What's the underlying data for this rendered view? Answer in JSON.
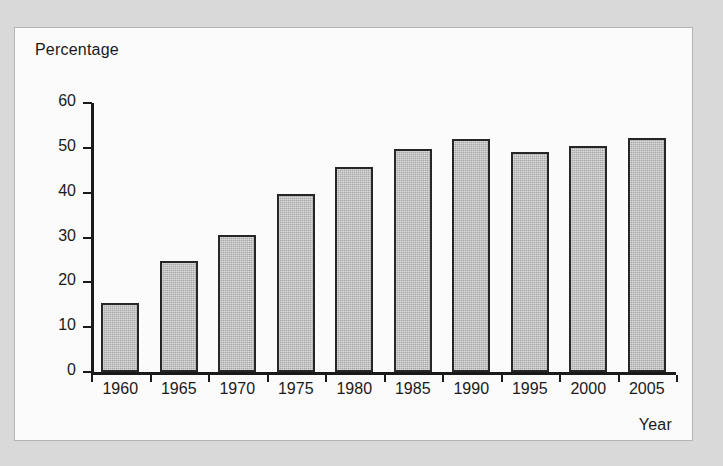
{
  "figure": {
    "background_color": "#d9d9d9",
    "panel_color": "#fbfbfb",
    "panel_border_color": "#b4b4b4"
  },
  "chart_data": {
    "type": "bar",
    "title": "",
    "xlabel": "Year",
    "ylabel": "Percentage",
    "categories": [
      "1960",
      "1965",
      "1970",
      "1975",
      "1980",
      "1985",
      "1990",
      "1995",
      "2000",
      "2005"
    ],
    "values": [
      15.5,
      24.7,
      30.6,
      39.6,
      45.7,
      49.7,
      51.9,
      49.0,
      50.5,
      52.2
    ],
    "ylim": [
      0,
      60
    ],
    "ytick_labels": [
      "0",
      "10",
      "20",
      "30",
      "40",
      "50",
      "60"
    ],
    "ytick_values": [
      0,
      10,
      20,
      30,
      40,
      50,
      60
    ],
    "grid": false,
    "legend": false,
    "bar_fill_color": "#a9a9a9",
    "bar_edge_color": "#262626",
    "axis_color": "#1a1a1a"
  }
}
